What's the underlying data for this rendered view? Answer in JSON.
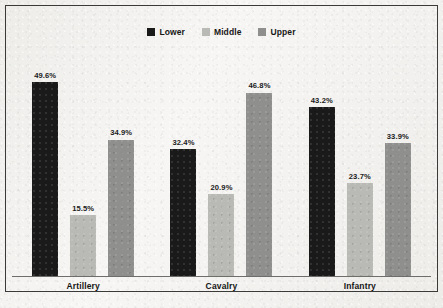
{
  "chart_data": {
    "type": "bar",
    "title": "",
    "subtitle": "",
    "xlabel": "",
    "ylabel": "",
    "ylim": [
      0,
      55
    ],
    "grid": false,
    "legend_position": "top-center",
    "categories": [
      "Artillery",
      "Cavalry",
      "Infantry"
    ],
    "series": [
      {
        "name": "Lower",
        "color": "#1a1a1a",
        "values": [
          49.6,
          32.4,
          43.2
        ],
        "labels": [
          "49.6%",
          "32.4%",
          "43.2%"
        ]
      },
      {
        "name": "Middle",
        "color": "#b9b9b6",
        "values": [
          15.5,
          20.9,
          23.7
        ],
        "labels": [
          "15.5%",
          "20.9%",
          "23.7%"
        ]
      },
      {
        "name": "Upper",
        "color": "#8f8f8d",
        "values": [
          34.9,
          46.8,
          33.9
        ],
        "labels": [
          "34.9%",
          "46.8%",
          "33.9%"
        ]
      }
    ]
  },
  "legend": {
    "entries": [
      {
        "label": "Lower",
        "color": "#1a1a1a"
      },
      {
        "label": "Middle",
        "color": "#b9b9b6"
      },
      {
        "label": "Upper",
        "color": "#8f8f8d"
      }
    ]
  },
  "axis": {
    "categories": [
      "Artillery",
      "Cavalry",
      "Infantry"
    ]
  },
  "style": {
    "background": "#f3f2ef",
    "frame_color": "#3a3a38",
    "axis_color": "#6d6d6b",
    "label_color": "#1b1b1b"
  }
}
